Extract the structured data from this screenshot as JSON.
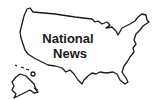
{
  "logo": {
    "line1": "National",
    "line2": "News",
    "shape": "us-map-outline",
    "stroke_color": "#1a1a1a",
    "background": "#ffffff"
  }
}
